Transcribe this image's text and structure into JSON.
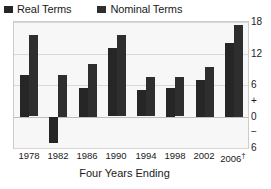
{
  "legend": {
    "position": "top-left",
    "items": [
      {
        "label": "Real Terms",
        "color": "#262626",
        "icon": "square-swatch"
      },
      {
        "label": "Nominal Terms",
        "color": "#2e2e2e",
        "icon": "square-swatch"
      }
    ]
  },
  "axis": {
    "x_title": "Four Years Ending",
    "y_ticks": [
      "18",
      "12",
      "6",
      "0",
      "6"
    ],
    "y_sign_plus": "+",
    "y_sign_minus": "−",
    "x_ticks": [
      "1978",
      "1982",
      "1986",
      "1990",
      "1994",
      "1998",
      "2002",
      "2006"
    ],
    "last_tick_marker": "†"
  },
  "chart_data": {
    "type": "bar",
    "title": "",
    "subtitle": "",
    "xlabel": "Four Years Ending",
    "ylabel": "",
    "ylim": [
      -6,
      18
    ],
    "yticks": [
      -6,
      0,
      6,
      12,
      18
    ],
    "grid": true,
    "legend_position": "top-left",
    "categories": [
      "1978",
      "1982",
      "1986",
      "1990",
      "1994",
      "1998",
      "2002",
      "2006†"
    ],
    "series": [
      {
        "name": "Real Terms",
        "color": "#262626",
        "values": [
          8.0,
          -5.0,
          5.5,
          13.0,
          5.0,
          5.5,
          7.0,
          14.0
        ]
      },
      {
        "name": "Nominal Terms",
        "color": "#2e2e2e",
        "values": [
          15.5,
          8.0,
          10.0,
          15.5,
          7.5,
          7.5,
          9.5,
          17.5
        ]
      }
    ],
    "annotations": [
      "† appended to final category label 2006"
    ]
  }
}
